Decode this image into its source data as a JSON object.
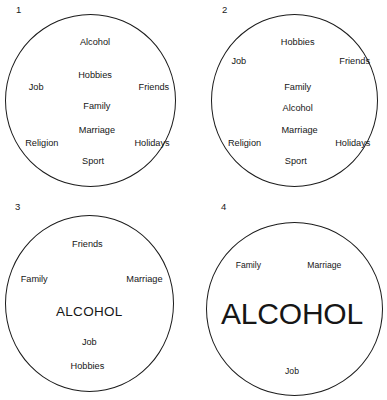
{
  "figure": {
    "background_color": "#ffffff",
    "stroke_color": "#1b1b1b",
    "text_color": "#161616",
    "panel_count": 4
  },
  "panels": [
    {
      "number": "1",
      "name": "panel-one-balanced",
      "alcohol_emphasis": "normal",
      "words": [
        {
          "text": "Alcohol",
          "x": 50,
          "y": 22,
          "size": "md"
        },
        {
          "text": "Hobbies",
          "x": 50,
          "y": 39,
          "size": "md"
        },
        {
          "text": "Job",
          "x": 19,
          "y": 45,
          "size": "md"
        },
        {
          "text": "Friends",
          "x": 81,
          "y": 45,
          "size": "md"
        },
        {
          "text": "Family",
          "x": 51,
          "y": 55,
          "size": "md"
        },
        {
          "text": "Marriage",
          "x": 51,
          "y": 67,
          "size": "md"
        },
        {
          "text": "Religion",
          "x": 22,
          "y": 74,
          "size": "md"
        },
        {
          "text": "Holidays",
          "x": 80,
          "y": 74,
          "size": "md"
        },
        {
          "text": "Sport",
          "x": 49,
          "y": 83,
          "size": "md"
        }
      ]
    },
    {
      "number": "2",
      "name": "panel-two-alcohol-central",
      "alcohol_emphasis": "central",
      "words": [
        {
          "text": "Hobbies",
          "x": 53,
          "y": 22,
          "size": "md"
        },
        {
          "text": "Job",
          "x": 22,
          "y": 32,
          "size": "md"
        },
        {
          "text": "Friends",
          "x": 83,
          "y": 32,
          "size": "md"
        },
        {
          "text": "Family",
          "x": 53,
          "y": 45,
          "size": "md"
        },
        {
          "text": "Alcohol",
          "x": 53,
          "y": 56,
          "size": "md"
        },
        {
          "text": "Marriage",
          "x": 54,
          "y": 67,
          "size": "md"
        },
        {
          "text": "Religion",
          "x": 25,
          "y": 74,
          "size": "md"
        },
        {
          "text": "Holidays",
          "x": 82,
          "y": 74,
          "size": "md"
        },
        {
          "text": "Sport",
          "x": 52,
          "y": 83,
          "size": "md"
        }
      ]
    },
    {
      "number": "3",
      "name": "panel-three-alcohol-dominant",
      "alcohol_emphasis": "dominant",
      "words": [
        {
          "text": "Friends",
          "x": 46,
          "y": 24,
          "size": "md"
        },
        {
          "text": "Family",
          "x": 18,
          "y": 41,
          "size": "md"
        },
        {
          "text": "Marriage",
          "x": 76,
          "y": 41,
          "size": "md"
        },
        {
          "text": "ALCOHOL",
          "x": 47,
          "y": 57,
          "size": "lg"
        },
        {
          "text": "Job",
          "x": 47,
          "y": 72,
          "size": "md"
        },
        {
          "text": "Hobbies",
          "x": 46,
          "y": 84,
          "size": "md"
        }
      ]
    },
    {
      "number": "4",
      "name": "panel-four-alcohol-overwhelming",
      "alcohol_emphasis": "overwhelming",
      "words": [
        {
          "text": "Family",
          "x": 27,
          "y": 34,
          "size": "sm"
        },
        {
          "text": "Marriage",
          "x": 67,
          "y": 34,
          "size": "sm"
        },
        {
          "text": "ALCOHOL",
          "x": 50,
          "y": 58,
          "size": "xl"
        },
        {
          "text": "Job",
          "x": 50,
          "y": 86,
          "size": "sm"
        }
      ]
    }
  ]
}
